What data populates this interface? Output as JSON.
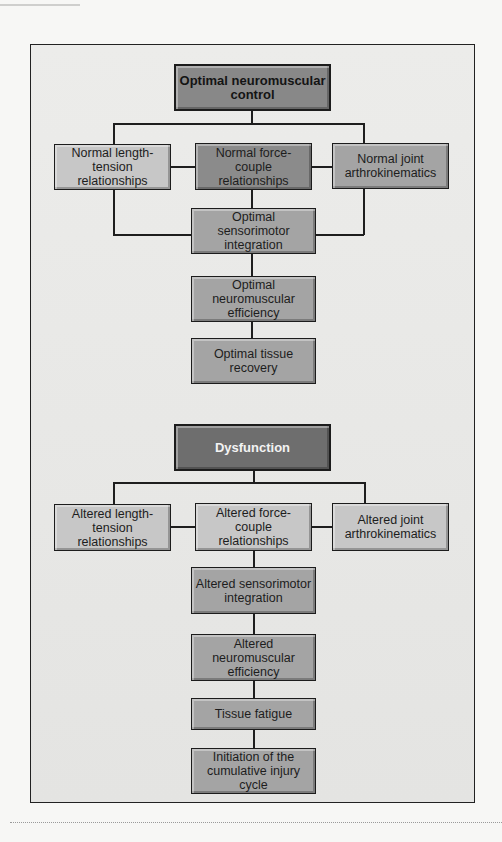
{
  "diagram": {
    "optimal_group": {
      "head": "Optimal neuromuscular control",
      "branches": [
        "Normal length-tension relationships",
        "Normal force-couple relationships",
        "Normal joint arthrokinematics"
      ],
      "chain": [
        "Optimal sensorimotor integration",
        "Optimal neuromuscular efficiency",
        "Optimal tissue recovery"
      ]
    },
    "dysfunction_group": {
      "head": "Dysfunction",
      "branches": [
        "Altered length-tension relationships",
        "Altered force-couple relationships",
        "Altered joint arthrokinematics"
      ],
      "chain": [
        "Altered sensorimotor integration",
        "Altered neuromuscular efficiency",
        "Tissue fatigue",
        "Initiation of the cumulative injury cycle"
      ]
    }
  }
}
